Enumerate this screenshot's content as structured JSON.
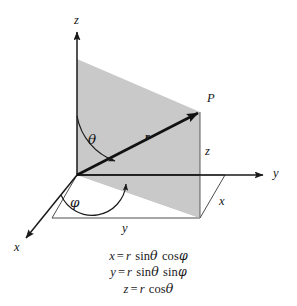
{
  "figure": {
    "type": "spherical-coordinates-diagram",
    "axes": {
      "z_label": "z",
      "y_label": "y",
      "x_label": "x"
    },
    "point_label": "P",
    "radius_label": "r",
    "angles": {
      "polar": "θ",
      "azimuth": "φ"
    },
    "projections": {
      "z_component": "z",
      "y_component": "y",
      "x_component": "x"
    },
    "colors": {
      "plane_fill": "#c9c9c9",
      "line": "#1a1a1a",
      "thin_line": "#3a3a3a",
      "background": "#ffffff"
    }
  },
  "equations": [
    {
      "lhs": "x",
      "eq": "=",
      "coef": "r",
      "fn1": "sin",
      "arg1": "θ",
      "fn2": "cos",
      "arg2": "φ"
    },
    {
      "lhs": "y",
      "eq": "=",
      "coef": "r",
      "fn1": "sin",
      "arg1": "θ",
      "fn2": "sin",
      "arg2": "φ"
    },
    {
      "lhs": "z",
      "eq": "=",
      "coef": "r",
      "fn1": "cos",
      "arg1": "θ",
      "fn2": "",
      "arg2": ""
    }
  ]
}
